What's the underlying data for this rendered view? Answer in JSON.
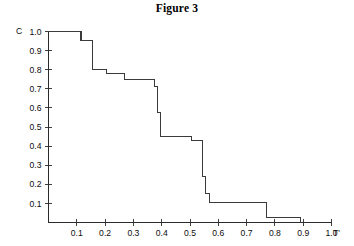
{
  "chart_data": {
    "type": "line",
    "title": "Figure 3",
    "xlabel": "T'",
    "ylabel": "C",
    "xlim": [
      0,
      1.0
    ],
    "ylim": [
      0,
      1.0
    ],
    "grid": false,
    "legend": null,
    "step_style": "post",
    "x_ticks": [
      0.1,
      0.2,
      0.3,
      0.4,
      0.5,
      0.6,
      0.7,
      0.8,
      0.9,
      1.0
    ],
    "x_tick_labels": [
      "0.1",
      "0.2",
      "0.3",
      "0.4",
      "0.5",
      "0.6",
      "0.7",
      "0.8",
      "0.9",
      "1.0"
    ],
    "y_ticks": [
      0.1,
      0.2,
      0.3,
      0.4,
      0.5,
      0.6,
      0.7,
      0.8,
      0.9,
      1.0
    ],
    "y_tick_labels": [
      "0.1",
      "0.2",
      "0.3",
      "0.4",
      "0.5",
      "0.6",
      "0.7",
      "0.8",
      "0.9",
      "1.0"
    ],
    "series": [
      {
        "name": "survival-step-curve",
        "x": [
          0.0,
          0.115,
          0.115,
          0.155,
          0.155,
          0.205,
          0.205,
          0.27,
          0.27,
          0.375,
          0.375,
          0.385,
          0.385,
          0.395,
          0.395,
          0.505,
          0.505,
          0.545,
          0.545,
          0.555,
          0.555,
          0.57,
          0.57,
          0.77,
          0.77,
          0.89,
          0.89
        ],
        "y": [
          1.0,
          1.0,
          0.955,
          0.955,
          0.8,
          0.8,
          0.78,
          0.78,
          0.75,
          0.75,
          0.71,
          0.71,
          0.575,
          0.575,
          0.45,
          0.45,
          0.43,
          0.43,
          0.24,
          0.24,
          0.15,
          0.15,
          0.105,
          0.105,
          0.025,
          0.025,
          0.0
        ]
      }
    ],
    "steps": [
      {
        "x": 0.0,
        "value": 1.0
      },
      {
        "x": 0.115,
        "value": 0.955
      },
      {
        "x": 0.155,
        "value": 0.8
      },
      {
        "x": 0.205,
        "value": 0.78
      },
      {
        "x": 0.27,
        "value": 0.75
      },
      {
        "x": 0.375,
        "value": 0.71
      },
      {
        "x": 0.385,
        "value": 0.575
      },
      {
        "x": 0.395,
        "value": 0.45
      },
      {
        "x": 0.505,
        "value": 0.43
      },
      {
        "x": 0.545,
        "value": 0.24
      },
      {
        "x": 0.555,
        "value": 0.15
      },
      {
        "x": 0.57,
        "value": 0.105
      },
      {
        "x": 0.77,
        "value": 0.025
      },
      {
        "x": 0.89,
        "value": 0.0
      }
    ]
  },
  "colors": {
    "background": "#ffffff",
    "axis": "#2b2b2b",
    "curve": "#3a3a3a",
    "text": "#0d0d0d"
  }
}
